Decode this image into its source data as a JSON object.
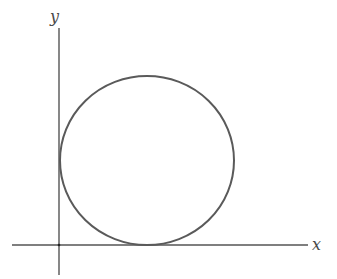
{
  "diagram": {
    "type": "geometric-plot",
    "axes": {
      "x_label": "x",
      "y_label": "y",
      "color": "#555555"
    },
    "circle": {
      "tangent_to": [
        "x-axis",
        "y-axis"
      ],
      "stroke_color": "#5a5a5a",
      "fill": "none"
    }
  }
}
